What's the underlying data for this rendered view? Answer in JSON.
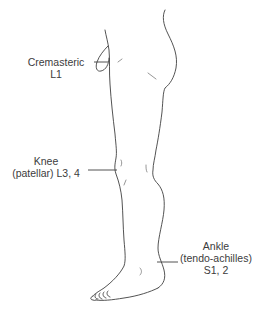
{
  "figure": {
    "reflexes": [
      {
        "name": "Cremasteric",
        "level": "L1",
        "lines": [
          "Cremasteric",
          "L1"
        ]
      },
      {
        "name": "Knee (patellar)",
        "level": "L3, 4",
        "lines": [
          "Knee",
          "(patellar) L3, 4"
        ]
      },
      {
        "name": "Ankle (tendo-achilles)",
        "level": "S1, 2",
        "lines": [
          "Ankle",
          "(tendo-achilles)",
          "S1, 2"
        ]
      }
    ]
  },
  "colors": {
    "line": "#3f3f3f",
    "text": "#3c3c3c",
    "background": "#ffffff"
  }
}
